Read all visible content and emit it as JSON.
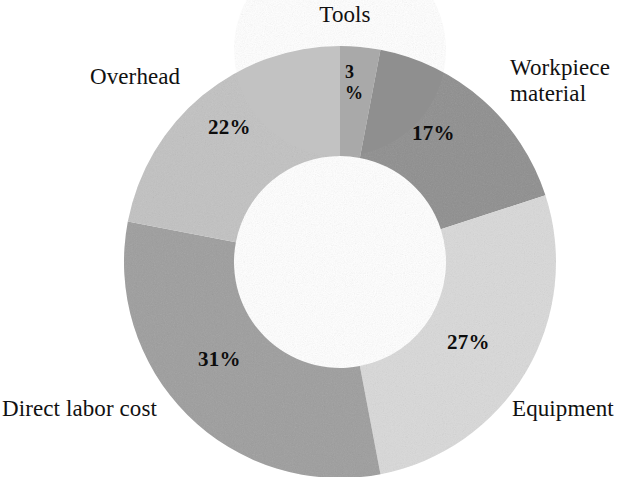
{
  "chart_data": {
    "type": "pie",
    "variant": "donut",
    "title": "",
    "subtitle": "",
    "xlabel": "",
    "ylabel": "",
    "units": "percent",
    "grid": false,
    "legend_position": "outside-labels",
    "total": 100,
    "start_angle_deg": 0,
    "direction": "clockwise",
    "inner_radius_ratio": 0.49,
    "categories": [
      "Tools",
      "Workpiece material",
      "Equipment",
      "Direct labor cost",
      "Overhead"
    ],
    "values": [
      3,
      17,
      27,
      31,
      22
    ],
    "value_labels": [
      "3\n%",
      "17%",
      "27%",
      "31%",
      "22%"
    ],
    "colors": [
      "#a9a9a9",
      "#8f8f8f",
      "#d9d9d9",
      "#9e9e9e",
      "#c2c2c2"
    ],
    "slices": [
      {
        "name": "Tools",
        "label": "Tools",
        "value": 3,
        "value_label_line1": "3",
        "value_label_line2": "%",
        "color": "#a9a9a9",
        "start_deg": 0,
        "end_deg": 10.8
      },
      {
        "name": "Workpiece material",
        "label_line1": "Workpiece",
        "label_line2": "material",
        "value": 17,
        "value_label": "17%",
        "color": "#8f8f8f",
        "start_deg": 10.8,
        "end_deg": 72.0
      },
      {
        "name": "Equipment",
        "label": "Equipment",
        "value": 27,
        "value_label": "27%",
        "color": "#d9d9d9",
        "start_deg": 72.0,
        "end_deg": 169.2
      },
      {
        "name": "Direct labor cost",
        "label": "Direct labor cost",
        "value": 31,
        "value_label": "31%",
        "color": "#9e9e9e",
        "start_deg": 169.2,
        "end_deg": 280.8
      },
      {
        "name": "Overhead",
        "label": "Overhead",
        "value": 22,
        "value_label": "22%",
        "color": "#c2c2c2",
        "start_deg": 280.8,
        "end_deg": 360.0
      }
    ]
  },
  "labels": {
    "tools": "Tools",
    "workpiece_line1": "Workpiece",
    "workpiece_line2": "material",
    "overhead": "Overhead",
    "direct_labor": "Direct labor cost",
    "equipment": "Equipment"
  },
  "percentages": {
    "tools_value": "3",
    "tools_sign": "%",
    "workpiece": "17%",
    "overhead": "22%",
    "equipment": "27%",
    "direct_labor": "31%"
  },
  "colors": {
    "background": "#ffffff",
    "text": "#111111",
    "tools": "#a9a9a9",
    "workpiece": "#8f8f8f",
    "equipment": "#d9d9d9",
    "direct_labor": "#9e9e9e",
    "overhead": "#c2c2c2"
  }
}
